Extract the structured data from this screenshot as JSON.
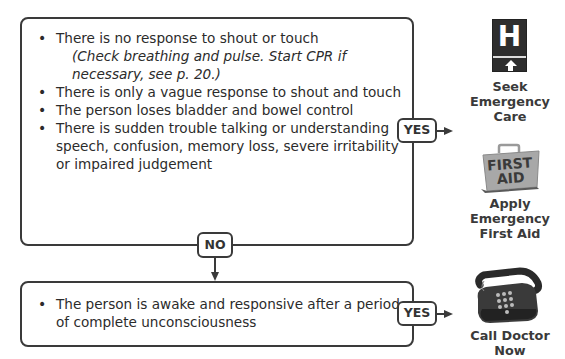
{
  "top_box": {
    "items": [
      "There is no response to shout or touch",
      "There is only a vague response to shout and touch",
      "The person loses bladder and bowel control",
      "There is sudden trouble talking or understanding speech, confusion, memory loss, severe irritability or impaired judgement"
    ],
    "note": "(Check breathing and pulse. Start CPR if necessary, see p. 20.)"
  },
  "bottom_box": {
    "items": [
      "The person is awake and responsive after a period of complete unconsciousness"
    ]
  },
  "connectors": {
    "yes_top": "YES",
    "no": "NO",
    "yes_bottom": "YES"
  },
  "outcomes": {
    "emergency_care": {
      "line1": "Seek",
      "line2": "Emergency",
      "line3": "Care",
      "icon": "hospital-sign-icon"
    },
    "first_aid": {
      "line1": "Apply",
      "line2": "Emergency",
      "line3": "First Aid",
      "icon": "first-aid-kit-icon",
      "kit_label_1": "FIRST",
      "kit_label_2": "AID"
    },
    "call_doctor": {
      "line1": "Call Doctor",
      "line2": "Now",
      "icon": "telephone-icon"
    }
  },
  "icon_text": {
    "hospital_letter": "H"
  },
  "colors": {
    "stroke": "#3a3a3a",
    "text": "#2b2b2b",
    "sign": "#2e2e2e"
  }
}
